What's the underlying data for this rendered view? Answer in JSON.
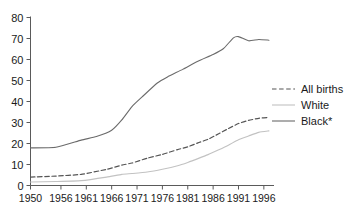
{
  "chart_data": {
    "type": "line",
    "title": "",
    "subtitle": "",
    "xlabel": "",
    "ylabel": "",
    "xlim": [
      1950,
      1998
    ],
    "ylim": [
      0,
      80
    ],
    "grid": false,
    "legend_position": "right",
    "y_ticks": [
      "0",
      "10",
      "20",
      "30",
      "40",
      "50",
      "60",
      "70",
      "80"
    ],
    "y_tick_values": [
      0,
      10,
      20,
      30,
      40,
      50,
      60,
      70,
      80
    ],
    "x_ticks": [
      "1950",
      "1956",
      "1961",
      "1966",
      "1971",
      "1976",
      "1981",
      "1986",
      "1991",
      "1996"
    ],
    "x_tick_values": [
      1950,
      1956,
      1961,
      1966,
      1971,
      1976,
      1981,
      1986,
      1991,
      1996
    ],
    "series": [
      {
        "name": "All births",
        "style": "dashed",
        "color": "#555555",
        "x": [
          1950,
          1955,
          1960,
          1965,
          1968,
          1970,
          1973,
          1976,
          1979,
          1981,
          1983,
          1985,
          1987,
          1989,
          1991,
          1993,
          1995,
          1997
        ],
        "values": [
          4.0,
          4.5,
          5.3,
          7.7,
          9.7,
          10.7,
          13.0,
          14.8,
          17.1,
          18.4,
          20.3,
          22.0,
          24.5,
          27.1,
          29.5,
          31.0,
          32.0,
          32.4
        ]
      },
      {
        "name": "White",
        "style": "solid",
        "color": "#c2c2c2",
        "x": [
          1950,
          1955,
          1960,
          1965,
          1968,
          1970,
          1973,
          1976,
          1979,
          1981,
          1983,
          1985,
          1987,
          1989,
          1991,
          1993,
          1995,
          1997
        ],
        "values": [
          1.7,
          1.9,
          2.3,
          4.0,
          5.3,
          5.7,
          6.4,
          7.7,
          9.4,
          11.0,
          12.8,
          14.7,
          16.9,
          19.2,
          21.8,
          23.6,
          25.3,
          26.0
        ]
      },
      {
        "name": "Black*",
        "style": "solid",
        "color": "#6b6b6b",
        "x": [
          1950,
          1955,
          1960,
          1963,
          1966,
          1968,
          1970,
          1972,
          1975,
          1977,
          1980,
          1983,
          1986,
          1988,
          1990,
          1991,
          1993,
          1995,
          1997
        ],
        "values": [
          17.9,
          18.2,
          21.6,
          23.3,
          26.3,
          31.2,
          37.6,
          42.2,
          48.8,
          51.7,
          55.3,
          59.2,
          62.4,
          65.1,
          70.3,
          70.9,
          68.9,
          69.5,
          69.2
        ]
      }
    ]
  },
  "legend": {
    "items": [
      {
        "label": "All births",
        "style": "dashed",
        "color": "#555555"
      },
      {
        "label": "White",
        "style": "solid",
        "color": "#c2c2c2"
      },
      {
        "label": "Black*",
        "style": "solid",
        "color": "#6b6b6b"
      }
    ]
  }
}
